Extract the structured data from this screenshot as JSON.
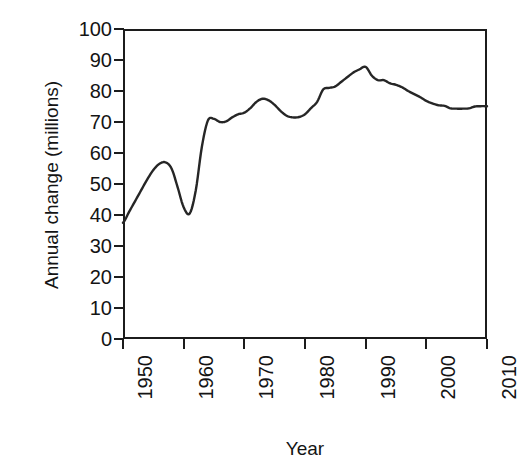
{
  "chart_data": {
    "type": "line",
    "title": "",
    "xlabel": "Year",
    "ylabel": "Annual change (millions)",
    "xlim": [
      1950,
      2010
    ],
    "ylim": [
      0,
      100
    ],
    "grid": false,
    "legend": null,
    "line_color": "#262626",
    "background_color": "#ffffff",
    "axis_color": "#1c1c1c",
    "xticks": [
      1950,
      1960,
      1970,
      1980,
      1990,
      2000,
      2010
    ],
    "xtick_labels": [
      "1950",
      "1960",
      "1970",
      "1980",
      "1990",
      "2000",
      "2010"
    ],
    "yticks": [
      0,
      10,
      20,
      30,
      40,
      50,
      60,
      70,
      80,
      90,
      100
    ],
    "ytick_labels": [
      "0",
      "10",
      "20",
      "30",
      "40",
      "50",
      "60",
      "70",
      "80",
      "90",
      "100"
    ],
    "x": [
      1950,
      1951,
      1952,
      1953,
      1954,
      1955,
      1956,
      1957,
      1958,
      1959,
      1960,
      1961,
      1962,
      1963,
      1964,
      1965,
      1966,
      1967,
      1968,
      1969,
      1970,
      1971,
      1972,
      1973,
      1974,
      1975,
      1976,
      1977,
      1978,
      1979,
      1980,
      1981,
      1982,
      1983,
      1984,
      1985,
      1986,
      1987,
      1988,
      1989,
      1990,
      1991,
      1992,
      1993,
      1994,
      1995,
      1996,
      1997,
      1998,
      1999,
      2000,
      2001,
      2002,
      2003,
      2004,
      2005,
      2006,
      2007,
      2008,
      2009,
      2010
    ],
    "values": [
      37.5,
      41.0,
      44.5,
      48.0,
      51.5,
      54.5,
      56.5,
      57.0,
      55.0,
      49.0,
      42.5,
      40.5,
      48.0,
      62.0,
      70.5,
      71.0,
      70.0,
      70.2,
      71.5,
      72.5,
      73.0,
      74.5,
      76.5,
      77.5,
      77.0,
      75.5,
      73.5,
      72.0,
      71.5,
      71.6,
      72.5,
      74.5,
      76.5,
      80.5,
      81.0,
      81.5,
      83.0,
      84.5,
      86.0,
      87.0,
      87.8,
      85.0,
      83.5,
      83.5,
      82.5,
      82.0,
      81.2,
      80.0,
      79.0,
      78.0,
      76.8,
      76.0,
      75.4,
      75.2,
      74.4,
      74.3,
      74.3,
      74.4,
      75.0,
      75.1,
      75.1
    ]
  },
  "axes": {
    "ylabel_text": "Annual change (millions)",
    "xlabel_text": "Year"
  }
}
